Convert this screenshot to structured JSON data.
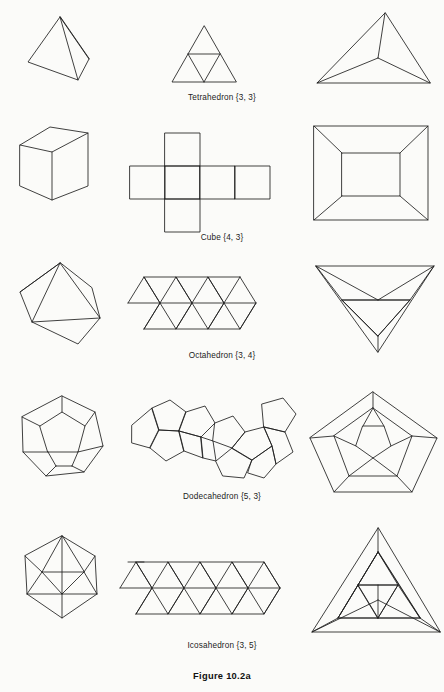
{
  "page": {
    "figure_label": "Figure 10.2a",
    "background_color": "#fbfbf9",
    "ink_color": "#1a1a1a",
    "width": 444,
    "height": 692
  },
  "columns": [
    {
      "key": "perspective",
      "label": "perspective view"
    },
    {
      "key": "net",
      "label": "net (unfolded)"
    },
    {
      "key": "schlegel",
      "label": "Schlegel diagram"
    }
  ],
  "rows": [
    {
      "key": "tetrahedron",
      "name": "Tetrahedron",
      "schlafli": "{3, 3}",
      "caption": "Tetrahedron {3, 3}",
      "faces": 4,
      "vertices": 4,
      "edges": 6,
      "face_polygon": "triangle",
      "net_faces": 4
    },
    {
      "key": "cube",
      "name": "Cube",
      "schlafli": "{4, 3}",
      "caption": "Cube {4, 3}",
      "faces": 6,
      "vertices": 8,
      "edges": 12,
      "face_polygon": "square",
      "net_faces": 6
    },
    {
      "key": "octahedron",
      "name": "Octahedron",
      "schlafli": "{3, 4}",
      "caption": "Octahedron {3, 4}",
      "faces": 8,
      "vertices": 6,
      "edges": 12,
      "face_polygon": "triangle",
      "net_faces": 8
    },
    {
      "key": "dodecahedron",
      "name": "Dodecahedron",
      "schlafli": "{5, 3}",
      "caption": "Dodecahedron {5, 3}",
      "faces": 12,
      "vertices": 20,
      "edges": 30,
      "face_polygon": "pentagon",
      "net_faces": 12
    },
    {
      "key": "icosahedron",
      "name": "Icosahedron",
      "schlafli": "{3, 5}",
      "caption": "Icosahedron {3, 5}",
      "faces": 20,
      "vertices": 12,
      "edges": 30,
      "face_polygon": "triangle",
      "net_faces": 20
    }
  ],
  "captions": {
    "tetrahedron": "Tetrahedron {3, 3}",
    "cube": "Cube {4, 3}",
    "octahedron": "Octahedron {3, 4}",
    "dodecahedron": "Dodecahedron {5, 3}",
    "icosahedron": "Icosahedron {3, 5}"
  }
}
